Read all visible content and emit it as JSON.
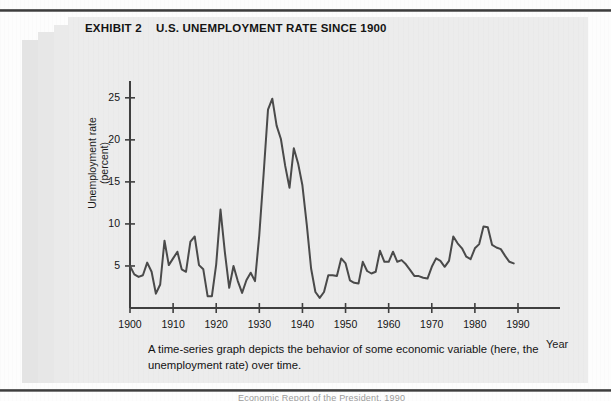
{
  "exhibit": {
    "label": "EXHIBIT 2",
    "title": "U.S. UNEMPLOYMENT RATE SINCE 1900",
    "caption": "A time-series graph depicts the behavior of some economic variable (here, the unemployment rate) over time.",
    "footer_cut_text": "Economic Report of the President, 1990"
  },
  "colors": {
    "page": "#fdfdfd",
    "panel": "#ececec",
    "line": "#4a4a4a",
    "axis": "#3f3f3f",
    "text": "#141414"
  },
  "chart_data": {
    "type": "line",
    "title": "U.S. UNEMPLOYMENT RATE SINCE 1900",
    "xlabel": "Year",
    "ylabel": "Unemployment rate (percent)",
    "xlim": [
      1900,
      1990
    ],
    "ylim": [
      0,
      27
    ],
    "grid": false,
    "legend": "none",
    "xticks": [
      1900,
      1910,
      1920,
      1930,
      1940,
      1950,
      1960,
      1970,
      1980,
      1990
    ],
    "yticks": [
      5,
      10,
      15,
      20,
      25
    ],
    "x": [
      1900,
      1901,
      1902,
      1903,
      1904,
      1905,
      1906,
      1907,
      1908,
      1909,
      1910,
      1911,
      1912,
      1913,
      1914,
      1915,
      1916,
      1917,
      1918,
      1919,
      1920,
      1921,
      1922,
      1923,
      1924,
      1925,
      1926,
      1927,
      1928,
      1929,
      1930,
      1931,
      1932,
      1933,
      1934,
      1935,
      1936,
      1937,
      1938,
      1939,
      1940,
      1941,
      1942,
      1943,
      1944,
      1945,
      1946,
      1947,
      1948,
      1949,
      1950,
      1951,
      1952,
      1953,
      1954,
      1955,
      1956,
      1957,
      1958,
      1959,
      1960,
      1961,
      1962,
      1963,
      1964,
      1965,
      1966,
      1967,
      1968,
      1969,
      1970,
      1971,
      1972,
      1973,
      1974,
      1975,
      1976,
      1977,
      1978,
      1979,
      1980,
      1981,
      1982,
      1983,
      1984,
      1985,
      1986,
      1987,
      1988,
      1989
    ],
    "values": [
      5.0,
      4.0,
      3.7,
      3.9,
      5.4,
      4.3,
      1.7,
      2.8,
      8.0,
      5.1,
      5.9,
      6.7,
      4.6,
      4.3,
      7.9,
      8.5,
      5.1,
      4.6,
      1.4,
      1.4,
      5.2,
      11.7,
      6.7,
      2.4,
      5.0,
      3.2,
      1.8,
      3.3,
      4.2,
      3.2,
      8.7,
      15.9,
      23.6,
      24.9,
      21.7,
      20.1,
      16.9,
      14.3,
      19.0,
      17.2,
      14.6,
      9.9,
      4.7,
      1.9,
      1.2,
      1.9,
      3.9,
      3.9,
      3.8,
      5.9,
      5.3,
      3.3,
      3.0,
      2.9,
      5.5,
      4.4,
      4.1,
      4.3,
      6.8,
      5.5,
      5.5,
      6.7,
      5.5,
      5.7,
      5.2,
      4.5,
      3.8,
      3.8,
      3.6,
      3.5,
      4.9,
      5.9,
      5.6,
      4.9,
      5.6,
      8.5,
      7.7,
      7.1,
      6.1,
      5.8,
      7.1,
      7.6,
      9.7,
      9.6,
      7.5,
      7.2,
      7.0,
      6.2,
      5.5,
      5.3
    ],
    "annotations": [
      {
        "label": "Great Depression peak",
        "x": 1933,
        "y": 24.9
      },
      {
        "label": "Wartime trough",
        "x": 1944,
        "y": 1.2
      },
      {
        "label": "1982 recession peak",
        "x": 1982,
        "y": 9.7
      }
    ]
  }
}
